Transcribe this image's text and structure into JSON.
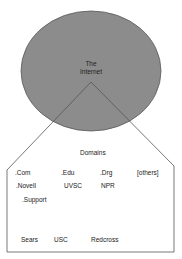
{
  "diagram": {
    "circle": {
      "label_line1": "The",
      "label_line2": "Internet",
      "fill": "#8c8c8c"
    },
    "box": {
      "title": "Domains",
      "row1": [
        ".Com",
        ".Edu",
        ".Drg",
        "[others]"
      ],
      "row2": [
        ".Novell",
        "UVSC",
        "NPR"
      ],
      "row3": [
        ".Support"
      ],
      "row4": [
        "Sears",
        "USC",
        "Redcross"
      ]
    },
    "colors": {
      "line": "#555555",
      "text": "#222222",
      "background": "#ffffff"
    }
  }
}
